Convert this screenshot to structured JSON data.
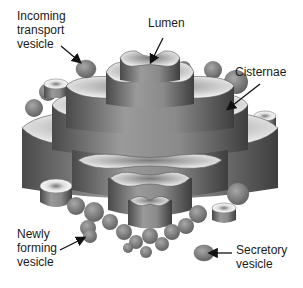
{
  "diagram": {
    "colors": {
      "background": "#ffffff",
      "membrane_dark": "#5a5a5a",
      "membrane_mid": "#8a8a8a",
      "membrane_light": "#e6e6e6",
      "vesicle": "#7d7d7d",
      "text": "#1a1a1a",
      "arrow": "#111111"
    },
    "labels": [
      {
        "id": "incoming",
        "lines": [
          "Incoming",
          "transport",
          "vesicle"
        ]
      },
      {
        "id": "lumen",
        "lines": [
          "Lumen"
        ]
      },
      {
        "id": "cisternae",
        "lines": [
          "Cisternae"
        ]
      },
      {
        "id": "newly",
        "lines": [
          "Newly",
          "forming",
          "vesicle"
        ]
      },
      {
        "id": "secretory",
        "lines": [
          "Secretory",
          "vesicle"
        ]
      }
    ]
  }
}
